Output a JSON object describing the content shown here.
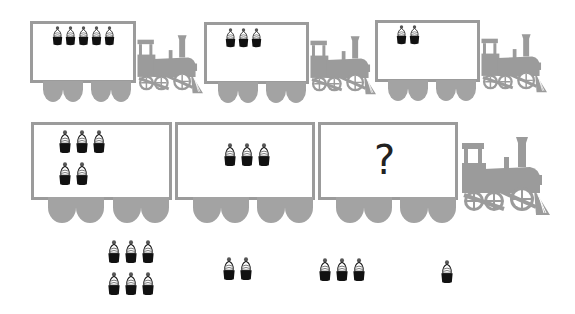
{
  "puzzle": {
    "description": "Train pattern puzzle with cupcakes",
    "row1": {
      "cars": [
        {
          "count": 5
        },
        {
          "count": 3
        },
        {
          "count": 2
        }
      ]
    },
    "row2": {
      "cars": [
        {
          "count": 5
        },
        {
          "count": 3
        },
        {
          "label": "?"
        }
      ]
    },
    "answer_options": [
      {
        "count": 6
      },
      {
        "count": 2
      },
      {
        "count": 3
      },
      {
        "count": 1
      }
    ]
  },
  "colors": {
    "train_gray": "#9b9b9b",
    "cupcake_base": "#111111",
    "background": "#ffffff"
  }
}
